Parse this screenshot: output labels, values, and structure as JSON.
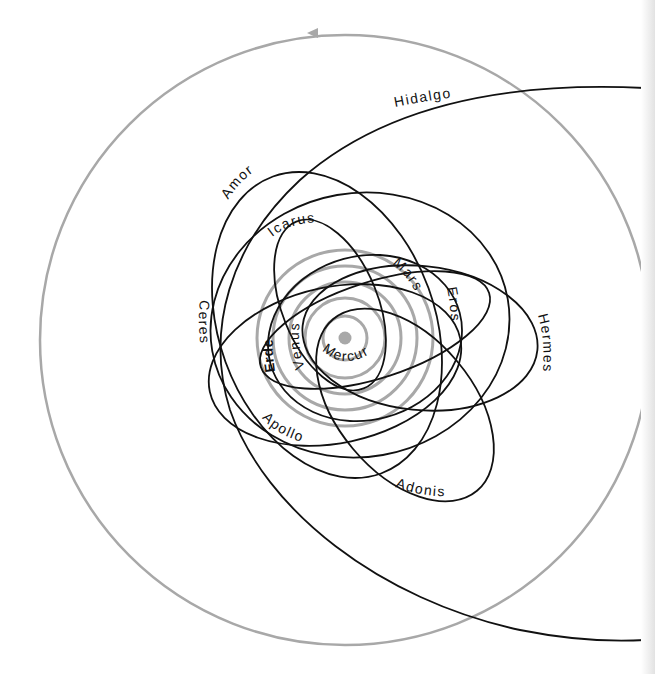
{
  "diagram": {
    "title": "",
    "colors": {
      "planet_orbit": "#a8a8a8",
      "asteroid_orbit": "#111111",
      "sun": "#a8a8a8",
      "background": "#ffffff"
    },
    "sun": {
      "label": ""
    },
    "planet_orbits": [
      {
        "name": "Mercur",
        "label": "Mercur"
      },
      {
        "name": "Venus",
        "label": "Venus"
      },
      {
        "name": "Erde",
        "label": "Erde"
      },
      {
        "name": "Mars",
        "label": "Mars"
      },
      {
        "name": "Jupiter",
        "label": ""
      }
    ],
    "asteroid_orbits": [
      {
        "name": "Hidalgo",
        "label": "Hidalgo"
      },
      {
        "name": "Amor",
        "label": "Amor"
      },
      {
        "name": "Icarus",
        "label": "Icarus"
      },
      {
        "name": "Ceres",
        "label": "Ceres"
      },
      {
        "name": "Eros",
        "label": "Eros"
      },
      {
        "name": "Hermes",
        "label": "Hermes"
      },
      {
        "name": "Apollo",
        "label": "Apollo"
      },
      {
        "name": "Adonis",
        "label": "Adonis"
      }
    ],
    "direction_arrow": "arrow-left-icon"
  }
}
